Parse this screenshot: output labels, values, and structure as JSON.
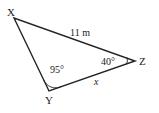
{
  "diagram": {
    "type": "triangle",
    "vertices": {
      "X": {
        "label": "X"
      },
      "Y": {
        "label": "Y",
        "angle": "95°"
      },
      "Z": {
        "label": "Z",
        "angle": "40°"
      }
    },
    "sides": {
      "XZ": {
        "label": "11 m"
      },
      "YZ": {
        "label": "x"
      }
    },
    "colors": {
      "stroke": "#222222",
      "background": "#ffffff"
    }
  }
}
